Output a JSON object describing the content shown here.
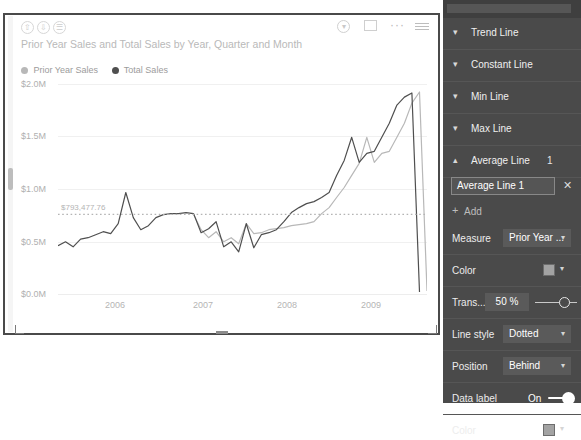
{
  "visual": {
    "title": "Prior Year Sales and Total Sales by Year, Quarter and Month",
    "header_icons": {
      "drill_up": "drill-up-icon",
      "drill_down": "drill-down-icon",
      "expand_hierarchy": "expand-hierarchy-icon",
      "menu": "hamburger-icon",
      "filter": "filter-icon",
      "focus_mode": "focus-mode-icon",
      "more_options": "···"
    },
    "legend": [
      {
        "label": "Prior Year Sales",
        "color": "#b8b8b8"
      },
      {
        "label": "Total Sales",
        "color": "#4f4f4f"
      }
    ]
  },
  "chart_data": {
    "type": "line",
    "title": "Prior Year Sales and Total Sales by Year, Quarter and Month",
    "xlabel": "",
    "ylabel": "",
    "ylim": [
      0,
      2100000
    ],
    "yticks": [
      0,
      500000,
      1000000,
      1500000,
      2000000
    ],
    "ytick_labels": [
      "$0.0M",
      "$0.5M",
      "$1.0M",
      "$1.5M",
      "$2.0M"
    ],
    "xticks": [
      2006,
      2007,
      2008,
      2009
    ],
    "xtick_labels": [
      "2006",
      "2007",
      "2008",
      "2009"
    ],
    "grid": true,
    "legend_position": "top-left",
    "annotations": [
      {
        "type": "average-line",
        "label": "$793,477.76",
        "value": 793477.76,
        "style": "Dotted",
        "color": "#b4b4b4"
      }
    ],
    "series": [
      {
        "name": "Total Sales",
        "color": "#4f4f4f",
        "values": [
          480000,
          520000,
          470000,
          545000,
          560000,
          590000,
          620000,
          600000,
          700000,
          1010000,
          760000,
          640000,
          680000,
          760000,
          790000,
          800000,
          800000,
          810000,
          800000,
          610000,
          650000,
          720000,
          470000,
          520000,
          420000,
          700000,
          460000,
          590000,
          610000,
          640000,
          720000,
          810000,
          860000,
          900000,
          920000,
          960000,
          1010000,
          1180000,
          1330000,
          1560000,
          1310000,
          1400000,
          1420000,
          1560000,
          1700000,
          1880000,
          1960000,
          2000000,
          20000
        ]
      },
      {
        "name": "Prior Year Sales",
        "color": "#b8b8b8",
        "values": [
          null,
          null,
          null,
          null,
          null,
          null,
          null,
          null,
          null,
          null,
          null,
          null,
          null,
          null,
          null,
          null,
          null,
          null,
          790000,
          640000,
          560000,
          620000,
          520000,
          560000,
          500000,
          700000,
          600000,
          610000,
          640000,
          650000,
          660000,
          680000,
          690000,
          700000,
          720000,
          800000,
          860000,
          960000,
          1060000,
          1180000,
          1300000,
          1560000,
          1310000,
          1400000,
          1420000,
          1560000,
          1700000,
          1900000,
          2010000,
          30000
        ]
      }
    ]
  },
  "pane": {
    "sections": [
      {
        "label": "Trend Line",
        "expanded": false,
        "chevron": "chevron-down",
        "count": ""
      },
      {
        "label": "Constant Line",
        "expanded": false,
        "chevron": "chevron-down",
        "count": ""
      },
      {
        "label": "Min Line",
        "expanded": false,
        "chevron": "chevron-down",
        "count": ""
      },
      {
        "label": "Max Line",
        "expanded": false,
        "chevron": "chevron-down",
        "count": ""
      },
      {
        "label": "Average Line",
        "expanded": true,
        "chevron": "chevron-up",
        "count": "1"
      }
    ],
    "average_line": {
      "name_value": "Average Line 1",
      "close_label": "✕",
      "add_label": "Add",
      "add_icon": "plus-icon",
      "measure_label": "Measure",
      "measure_value": "Prior Year ...",
      "color_label": "Color",
      "color_value": "#a3a3a3",
      "transparency_label": "Trans...",
      "transparency_value": "50",
      "transparency_unit": "%",
      "line_style_label": "Line style",
      "line_style_value": "Dotted",
      "position_label": "Position",
      "position_value": "Behind",
      "data_label_label": "Data label",
      "data_label_value": "On",
      "data_label_color_label": "Color",
      "data_label_color_value": "#a3a3a3"
    }
  }
}
